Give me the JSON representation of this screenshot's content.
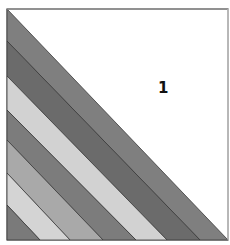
{
  "figure": {
    "type": "striped-triangle-square",
    "frame": {
      "x": 7,
      "y": 9,
      "width": 221,
      "height": 231,
      "border_color": "#8a8a8a",
      "background": "#ffffff"
    },
    "region_label": {
      "text": "1",
      "x": 158,
      "y": 79
    },
    "stripes": [
      {
        "index": 1,
        "color": "#7f7f7f",
        "left_y_top": 9,
        "left_y_bottom": 41,
        "bottom_x_left": 200,
        "bottom_x_right": 228
      },
      {
        "index": 2,
        "color": "#6b6b6b",
        "left_y_top": 41,
        "left_y_bottom": 76,
        "bottom_x_left": 167,
        "bottom_x_right": 200
      },
      {
        "index": 3,
        "color": "#d2d2d2",
        "left_y_top": 76,
        "left_y_bottom": 110,
        "bottom_x_left": 136,
        "bottom_x_right": 167
      },
      {
        "index": 4,
        "color": "#7c7c7c",
        "left_y_top": 110,
        "left_y_bottom": 140,
        "bottom_x_left": 103,
        "bottom_x_right": 136
      },
      {
        "index": 5,
        "color": "#a9a9a9",
        "left_y_top": 140,
        "left_y_bottom": 173,
        "bottom_x_left": 70,
        "bottom_x_right": 103
      },
      {
        "index": 6,
        "color": "#d4d4d4",
        "left_y_top": 173,
        "left_y_bottom": 205,
        "bottom_x_left": 40,
        "bottom_x_right": 70
      },
      {
        "index": 7,
        "color": "#7a7a7a",
        "left_y_top": 205,
        "left_y_bottom": 240,
        "bottom_x_left": 7,
        "bottom_x_right": 40
      }
    ],
    "stripe_edge_color": "#3a3a3a"
  }
}
